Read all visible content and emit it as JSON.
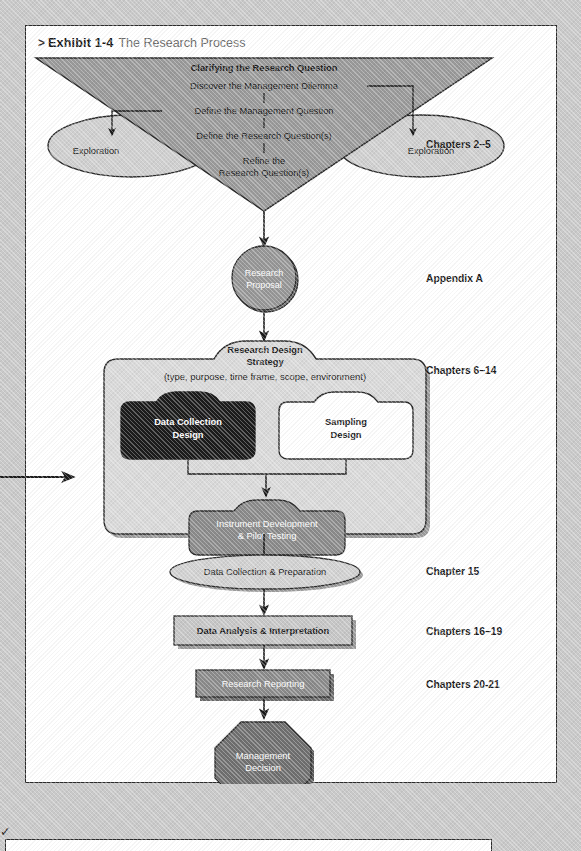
{
  "exhibit": {
    "caret": ">",
    "label": "Exhibit 1-4",
    "title": "The Research Process"
  },
  "funnel": {
    "heading": "Clarifying the Research Question",
    "steps": [
      "Discover the Management Dilemma",
      "Define the Management Question",
      "Define the Research Question(s)",
      "Refine the",
      "Research Question(s)"
    ],
    "exploration_left": "Exploration",
    "exploration_right": "Exploration"
  },
  "nodes": {
    "research_proposal_line1": "Research",
    "research_proposal_line2": "Proposal",
    "design_title_line1": "Research Design",
    "design_title_line2": "Strategy",
    "design_subtitle": "(type, purpose, time frame, scope, environment)",
    "data_collection_design_line1": "Data Collection",
    "data_collection_design_line2": "Design",
    "sampling_design_line1": "Sampling",
    "sampling_design_line2": "Design",
    "instrument_line1": "Instrument Development",
    "instrument_line2": "& Pilot Testing",
    "data_collection_prep": "Data Collection & Preparation",
    "data_analysis": "Data Analysis & Interpretation",
    "research_reporting": "Research Reporting",
    "management_decision_line1": "Management",
    "management_decision_line2": "Decision"
  },
  "chapters": {
    "clarifying": "Chapters 2–5",
    "proposal": "Appendix A",
    "design": "Chapters 6–14",
    "collection": "Chapter 15",
    "analysis": "Chapters 16–19",
    "reporting": "Chapters 20-21"
  },
  "colors": {
    "page_background": "#c9c9c9",
    "panel_background": "#ffffff",
    "panel_border": "#2b2b2b",
    "funnel_fill": "#9a9a9a",
    "exploration_fill": "#cfcfcf",
    "proposal_fill": "#8f8f8f",
    "design_box_fill": "#d8d8d8",
    "data_collection_fill": "#1c1c1c",
    "sampling_fill": "#ffffff",
    "instrument_fill": "#8a8a8a",
    "oval_fill": "#cfcfcf",
    "analysis_fill": "#c3c3c3",
    "reporting_fill": "#8a8a8a",
    "decision_fill": "#6f6f6f",
    "stroke": "#2b2b2b",
    "caption_gray": "#6b6b6b"
  },
  "stray_mark": "✓"
}
